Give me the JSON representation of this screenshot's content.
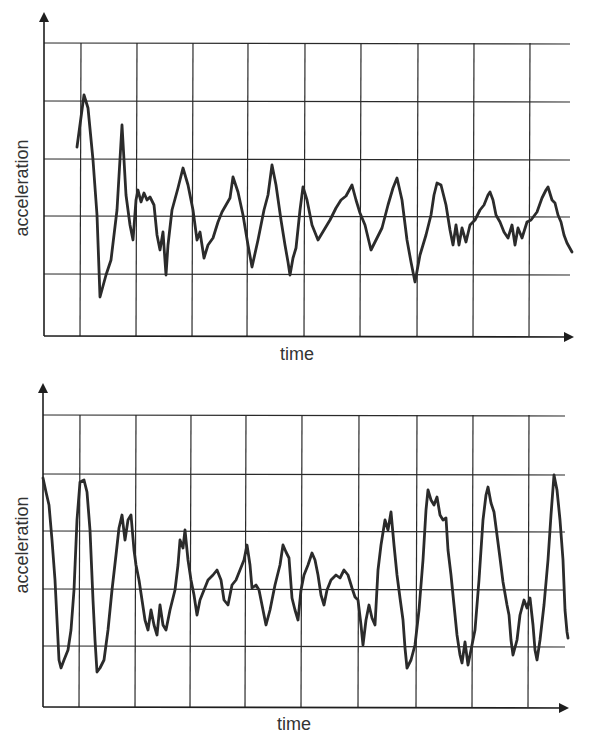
{
  "colors": {
    "line": "#2b2b2b",
    "grid": "#2a2a2a",
    "background": "#ffffff",
    "text": "#333333"
  },
  "chart_data": [
    {
      "type": "line",
      "title": "",
      "xlabel": "time",
      "ylabel": "acceleration",
      "grid": true,
      "ticks_labeled": false,
      "description": "Decaying oscillation, damped to small irregular noise",
      "frame": {
        "axis_x": 44,
        "axis_y": 336,
        "x_end": 572,
        "y_top_arrow": 14,
        "hlines": [
          43,
          101,
          159,
          216,
          274
        ],
        "vlines": [
          81,
          137,
          193,
          248,
          305,
          361,
          418,
          474,
          530
        ]
      },
      "label_pos": {
        "xlabel": [
          297,
          360
        ],
        "ylabel": [
          28,
          188
        ]
      },
      "points": [
        [
          77,
          147
        ],
        [
          84,
          95
        ],
        [
          88,
          108
        ],
        [
          93,
          160
        ],
        [
          97,
          215
        ],
        [
          100,
          297
        ],
        [
          106,
          275
        ],
        [
          111,
          260
        ],
        [
          117,
          210
        ],
        [
          122,
          125
        ],
        [
          126,
          195
        ],
        [
          130,
          225
        ],
        [
          133,
          240
        ],
        [
          136,
          200
        ],
        [
          138,
          190
        ],
        [
          141,
          202
        ],
        [
          144,
          193
        ],
        [
          147,
          200
        ],
        [
          150,
          197
        ],
        [
          154,
          205
        ],
        [
          157,
          235
        ],
        [
          160,
          250
        ],
        [
          163,
          232
        ],
        [
          166,
          275
        ],
        [
          168,
          245
        ],
        [
          172,
          210
        ],
        [
          178,
          188
        ],
        [
          183,
          168
        ],
        [
          188,
          185
        ],
        [
          193,
          210
        ],
        [
          197,
          240
        ],
        [
          200,
          232
        ],
        [
          204,
          258
        ],
        [
          208,
          245
        ],
        [
          213,
          238
        ],
        [
          218,
          222
        ],
        [
          222,
          212
        ],
        [
          226,
          205
        ],
        [
          230,
          198
        ],
        [
          233,
          177
        ],
        [
          238,
          192
        ],
        [
          243,
          215
        ],
        [
          248,
          245
        ],
        [
          252,
          267
        ],
        [
          258,
          240
        ],
        [
          264,
          210
        ],
        [
          268,
          195
        ],
        [
          272,
          165
        ],
        [
          276,
          185
        ],
        [
          281,
          220
        ],
        [
          285,
          245
        ],
        [
          288,
          262
        ],
        [
          290,
          275
        ],
        [
          293,
          258
        ],
        [
          296,
          248
        ],
        [
          300,
          210
        ],
        [
          303,
          187
        ],
        [
          307,
          200
        ],
        [
          312,
          225
        ],
        [
          318,
          240
        ],
        [
          324,
          230
        ],
        [
          330,
          220
        ],
        [
          336,
          208
        ],
        [
          341,
          200
        ],
        [
          346,
          196
        ],
        [
          352,
          185
        ],
        [
          356,
          200
        ],
        [
          360,
          213
        ],
        [
          365,
          225
        ],
        [
          371,
          250
        ],
        [
          376,
          240
        ],
        [
          382,
          228
        ],
        [
          388,
          205
        ],
        [
          393,
          188
        ],
        [
          397,
          178
        ],
        [
          402,
          200
        ],
        [
          407,
          240
        ],
        [
          411,
          262
        ],
        [
          415,
          282
        ],
        [
          420,
          255
        ],
        [
          426,
          235
        ],
        [
          431,
          215
        ],
        [
          434,
          195
        ],
        [
          437,
          183
        ],
        [
          441,
          185
        ],
        [
          446,
          205
        ],
        [
          450,
          230
        ],
        [
          453,
          245
        ],
        [
          456,
          225
        ],
        [
          459,
          245
        ],
        [
          462,
          228
        ],
        [
          466,
          242
        ],
        [
          470,
          225
        ],
        [
          475,
          220
        ],
        [
          480,
          210
        ],
        [
          484,
          205
        ],
        [
          488,
          195
        ],
        [
          490,
          192
        ],
        [
          493,
          200
        ],
        [
          496,
          215
        ],
        [
          500,
          222
        ],
        [
          504,
          232
        ],
        [
          508,
          238
        ],
        [
          512,
          225
        ],
        [
          515,
          245
        ],
        [
          518,
          228
        ],
        [
          522,
          238
        ],
        [
          527,
          222
        ],
        [
          531,
          220
        ],
        [
          537,
          212
        ],
        [
          542,
          198
        ],
        [
          546,
          190
        ],
        [
          548,
          187
        ],
        [
          552,
          200
        ],
        [
          555,
          203
        ],
        [
          558,
          215
        ],
        [
          561,
          222
        ],
        [
          564,
          235
        ],
        [
          567,
          243
        ],
        [
          572,
          252
        ]
      ]
    },
    {
      "type": "line",
      "title": "",
      "xlabel": "time",
      "ylabel": "acceleration",
      "grid": true,
      "ticks_labeled": false,
      "description": "Large oscillation that dies down to noise then grows again (resonance build-up)",
      "frame": {
        "axis_x": 43,
        "axis_y": 707,
        "x_end": 567,
        "y_top_arrow": 385,
        "hlines": [
          415,
          474,
          531,
          589,
          646
        ],
        "vlines": [
          80,
          136,
          191,
          246,
          302,
          359,
          417,
          473,
          529
        ]
      },
      "label_pos": {
        "xlabel": [
          294,
          730
        ],
        "ylabel": [
          28,
          545
        ]
      },
      "points": [
        [
          43,
          478
        ],
        [
          46,
          492
        ],
        [
          49,
          505
        ],
        [
          52,
          540
        ],
        [
          55,
          580
        ],
        [
          57,
          620
        ],
        [
          59,
          660
        ],
        [
          61,
          668
        ],
        [
          64,
          660
        ],
        [
          68,
          650
        ],
        [
          71,
          630
        ],
        [
          74,
          590
        ],
        [
          77,
          520
        ],
        [
          80,
          482
        ],
        [
          84,
          480
        ],
        [
          87,
          492
        ],
        [
          90,
          530
        ],
        [
          93,
          600
        ],
        [
          95,
          640
        ],
        [
          97,
          672
        ],
        [
          100,
          668
        ],
        [
          104,
          660
        ],
        [
          108,
          630
        ],
        [
          112,
          590
        ],
        [
          116,
          555
        ],
        [
          119,
          528
        ],
        [
          122,
          515
        ],
        [
          125,
          540
        ],
        [
          128,
          520
        ],
        [
          131,
          515
        ],
        [
          134,
          550
        ],
        [
          136,
          565
        ],
        [
          139,
          580
        ],
        [
          142,
          600
        ],
        [
          145,
          620
        ],
        [
          148,
          630
        ],
        [
          151,
          610
        ],
        [
          154,
          625
        ],
        [
          157,
          635
        ],
        [
          160,
          605
        ],
        [
          163,
          625
        ],
        [
          166,
          630
        ],
        [
          170,
          610
        ],
        [
          175,
          590
        ],
        [
          178,
          565
        ],
        [
          180,
          540
        ],
        [
          183,
          548
        ],
        [
          185,
          530
        ],
        [
          188,
          560
        ],
        [
          191,
          580
        ],
        [
          194,
          595
        ],
        [
          197,
          615
        ],
        [
          200,
          600
        ],
        [
          204,
          590
        ],
        [
          208,
          580
        ],
        [
          213,
          575
        ],
        [
          217,
          570
        ],
        [
          221,
          580
        ],
        [
          224,
          600
        ],
        [
          228,
          605
        ],
        [
          232,
          585
        ],
        [
          236,
          580
        ],
        [
          240,
          570
        ],
        [
          244,
          560
        ],
        [
          247,
          545
        ],
        [
          250,
          565
        ],
        [
          252,
          588
        ],
        [
          256,
          585
        ],
        [
          259,
          590
        ],
        [
          262,
          605
        ],
        [
          266,
          625
        ],
        [
          270,
          610
        ],
        [
          275,
          585
        ],
        [
          280,
          565
        ],
        [
          283,
          545
        ],
        [
          286,
          552
        ],
        [
          289,
          558
        ],
        [
          292,
          598
        ],
        [
          295,
          610
        ],
        [
          298,
          620
        ],
        [
          301,
          590
        ],
        [
          304,
          575
        ],
        [
          308,
          565
        ],
        [
          312,
          553
        ],
        [
          315,
          560
        ],
        [
          318,
          575
        ],
        [
          321,
          595
        ],
        [
          324,
          605
        ],
        [
          327,
          590
        ],
        [
          331,
          580
        ],
        [
          336,
          575
        ],
        [
          340,
          578
        ],
        [
          344,
          570
        ],
        [
          348,
          575
        ],
        [
          352,
          588
        ],
        [
          355,
          597
        ],
        [
          358,
          600
        ],
        [
          361,
          625
        ],
        [
          363,
          645
        ],
        [
          366,
          620
        ],
        [
          369,
          605
        ],
        [
          372,
          618
        ],
        [
          375,
          625
        ],
        [
          378,
          570
        ],
        [
          381,
          545
        ],
        [
          385,
          520
        ],
        [
          388,
          530
        ],
        [
          391,
          512
        ],
        [
          394,
          545
        ],
        [
          397,
          575
        ],
        [
          400,
          598
        ],
        [
          403,
          620
        ],
        [
          405,
          648
        ],
        [
          407,
          668
        ],
        [
          411,
          660
        ],
        [
          415,
          645
        ],
        [
          419,
          610
        ],
        [
          423,
          560
        ],
        [
          426,
          510
        ],
        [
          428,
          490
        ],
        [
          431,
          500
        ],
        [
          434,
          505
        ],
        [
          437,
          497
        ],
        [
          440,
          515
        ],
        [
          443,
          520
        ],
        [
          446,
          518
        ],
        [
          448,
          550
        ],
        [
          451,
          575
        ],
        [
          454,
          605
        ],
        [
          457,
          635
        ],
        [
          460,
          655
        ],
        [
          462,
          663
        ],
        [
          465,
          642
        ],
        [
          468,
          665
        ],
        [
          472,
          645
        ],
        [
          475,
          630
        ],
        [
          479,
          580
        ],
        [
          483,
          520
        ],
        [
          486,
          495
        ],
        [
          488,
          487
        ],
        [
          491,
          503
        ],
        [
          494,
          512
        ],
        [
          497,
          535
        ],
        [
          500,
          558
        ],
        [
          503,
          582
        ],
        [
          507,
          605
        ],
        [
          509,
          615
        ],
        [
          511,
          640
        ],
        [
          513,
          655
        ],
        [
          517,
          640
        ],
        [
          520,
          615
        ],
        [
          524,
          600
        ],
        [
          527,
          608
        ],
        [
          530,
          598
        ],
        [
          533,
          625
        ],
        [
          535,
          650
        ],
        [
          537,
          660
        ],
        [
          540,
          640
        ],
        [
          544,
          605
        ],
        [
          548,
          560
        ],
        [
          551,
          515
        ],
        [
          554,
          475
        ],
        [
          557,
          490
        ],
        [
          560,
          520
        ],
        [
          563,
          560
        ],
        [
          565,
          610
        ],
        [
          567,
          632
        ],
        [
          568,
          638
        ]
      ]
    }
  ],
  "labels": {
    "top": {
      "xlabel": "time",
      "ylabel": "acceleration"
    },
    "bottom": {
      "xlabel": "time",
      "ylabel": "acceleration"
    }
  }
}
